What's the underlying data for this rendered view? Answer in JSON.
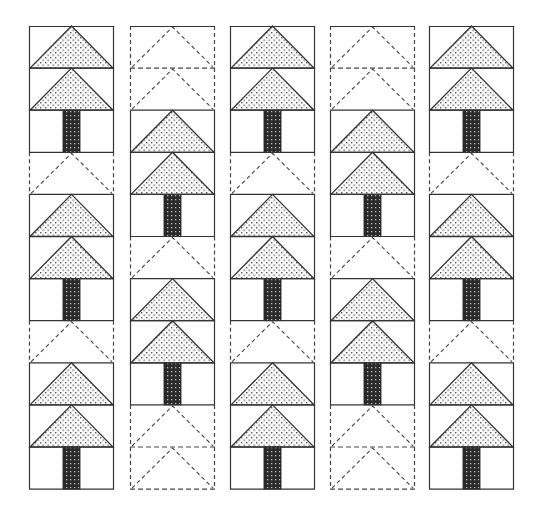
{
  "colors": {
    "line": "#333333",
    "dashed_line": "#444444",
    "triangle_fill": "#ffffff",
    "triangle_dot": "#555555",
    "trunk_fill": "#2a2a2a",
    "trunk_dot": "#bbbbbb",
    "background": "#ffffff"
  },
  "layout": {
    "columns_x": [
      29,
      130,
      230,
      330,
      429
    ],
    "column_width": 85,
    "top": 26,
    "row_height": 42.1,
    "rows": 11
  },
  "legend": {
    "tri": "Dotted tree triangle (solid outline)",
    "trunk": "Dark dotted trunk block",
    "dash": "Dashed-outline placeholder triangle"
  },
  "columns": [
    {
      "name": "column-1",
      "blocks": [
        "tri",
        "tri",
        "trunk",
        "dash",
        "tri",
        "tri",
        "trunk",
        "dash",
        "tri",
        "tri",
        "trunk"
      ]
    },
    {
      "name": "column-2",
      "blocks": [
        "dash",
        "dash",
        "tri",
        "tri",
        "trunk",
        "dash",
        "tri",
        "tri",
        "trunk",
        "dash",
        "dash"
      ]
    },
    {
      "name": "column-3",
      "blocks": [
        "tri",
        "tri",
        "trunk",
        "dash",
        "tri",
        "tri",
        "trunk",
        "dash",
        "tri",
        "tri",
        "trunk"
      ]
    },
    {
      "name": "column-4",
      "blocks": [
        "dash",
        "dash",
        "tri",
        "tri",
        "trunk",
        "dash",
        "tri",
        "tri",
        "trunk",
        "dash",
        "dash"
      ]
    },
    {
      "name": "column-5",
      "blocks": [
        "tri",
        "tri",
        "trunk",
        "dash",
        "tri",
        "tri",
        "trunk",
        "dash",
        "tri",
        "tri",
        "trunk"
      ]
    }
  ]
}
